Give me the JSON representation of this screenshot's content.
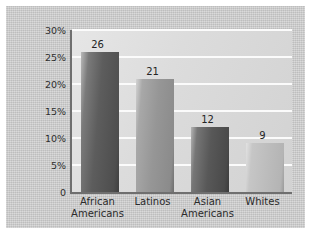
{
  "chart_data": {
    "type": "bar",
    "title": "",
    "subtitle": "",
    "xlabel": "",
    "ylabel": "Percentage",
    "categories": [
      "African Americans",
      "Latinos",
      "Asian Americans",
      "Whites"
    ],
    "category_lines": [
      [
        "African",
        "Americans"
      ],
      [
        "Latinos"
      ],
      [
        "Asian",
        "Americans"
      ],
      [
        "Whites"
      ]
    ],
    "values": [
      26,
      21,
      12,
      9
    ],
    "value_labels": [
      "26",
      "21",
      "12",
      "9"
    ],
    "ylim": [
      0,
      30
    ],
    "yticks": [
      0,
      5,
      10,
      15,
      20,
      25,
      30
    ],
    "ytick_labels": [
      "0",
      "5%",
      "10%",
      "15%",
      "20%",
      "25%",
      "30%"
    ],
    "grid": "horizontal",
    "legend": "none",
    "bar_colors": [
      "#4e4e4e",
      "#8e8e8e",
      "#4a4a4a",
      "#bdbdbd"
    ],
    "plot_background": "#dcdcdc",
    "figure_background": "#c4c4c4",
    "gridline_color": "#fbfbfb",
    "axis_color": "#6f6f6f"
  }
}
